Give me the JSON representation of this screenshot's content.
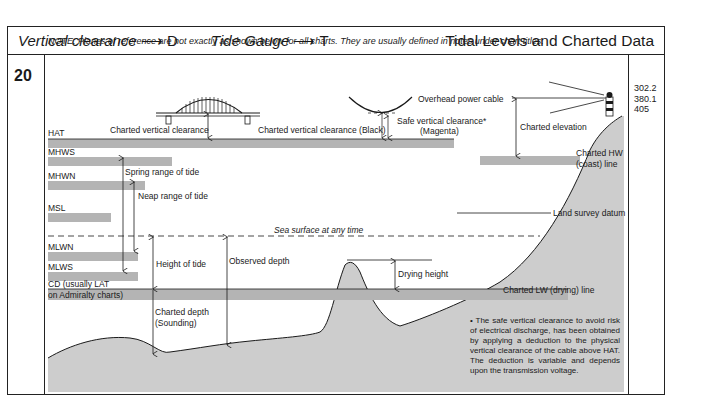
{
  "header": {
    "vertical_clearance_label": "Vertical clearance",
    "vertical_clearance_arrow": "⟶",
    "vertical_clearance_code": "D",
    "tide_gauge_label": "Tide Gauge",
    "tide_gauge_arrow": "⟶",
    "tide_gauge_code": "T",
    "title": "Tidal Levels and Charted Data"
  },
  "section_number": "20",
  "note": "NOTE: Planes of reference are not exactly as shown below for all charts. They are usually defined in notes under chart titles.",
  "references": [
    "302.2",
    "380.1",
    "405"
  ],
  "tidal_levels": {
    "hat": "HAT",
    "mhws": "MHWS",
    "mhwn": "MHWN",
    "msl": "MSL",
    "mlwn": "MLWN",
    "mlws": "MLWS",
    "cd_line1": "CD (usually LAT",
    "cd_line2": "on Admiralty charts)"
  },
  "labels": {
    "charted_vertical_clearance": "Charted vertical clearance",
    "charted_vertical_clearance_black": "Charted vertical clearance (Black)",
    "overhead_power_cable": "Overhead power cable",
    "safe_vertical_clearance": "Safe vertical clearance*",
    "magenta": "(Magenta)",
    "charted_elevation": "Charted elevation",
    "charted_hw_line1": "Charted HW",
    "charted_hw_line2": "(coast) line",
    "spring_range": "Spring range of tide",
    "neap_range": "Neap range of tide",
    "land_survey_datum": "Land survey datum",
    "sea_surface": "Sea surface at any time",
    "height_of_tide": "Height of tide",
    "observed_depth": "Observed depth",
    "drying_height": "Drying height",
    "charted_lw_line": "Charted LW (drying) line",
    "charted_depth_line1": "Charted depth",
    "charted_depth_line2": "(Sounding)"
  },
  "footnote": "• The safe vertical clearance to avoid risk of electrical discharge, has been obtained by applying a deduction to the physical vertical clearance of the cable above HAT. The deduction is variable and depends upon the transmission voltage.",
  "colors": {
    "band": "#b4b4b4",
    "land": "#cdcdcd",
    "line": "#1a1a1a"
  }
}
